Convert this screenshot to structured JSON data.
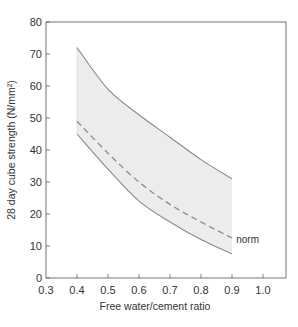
{
  "chart_data": {
    "type": "line",
    "title": "",
    "xlabel": "Free water/cement ratio",
    "ylabel": "28 day cube strength (N/mm²)",
    "xlim": [
      0.3,
      1.05
    ],
    "ylim": [
      0,
      80
    ],
    "xticks": [
      0.3,
      0.4,
      0.5,
      0.6,
      0.7,
      0.8,
      0.9,
      1.0
    ],
    "xtick_labels": [
      "0.3",
      "0.4",
      "0.5",
      "0.6",
      "0.7",
      "0.8",
      "0.9",
      "1.0"
    ],
    "yticks": [
      0,
      10,
      20,
      30,
      40,
      50,
      60,
      70,
      80
    ],
    "ytick_labels": [
      "0",
      "10",
      "20",
      "30",
      "40",
      "50",
      "60",
      "70",
      "80"
    ],
    "grid": false,
    "frame": "box",
    "x": [
      0.4,
      0.5,
      0.6,
      0.7,
      0.8,
      0.9
    ],
    "series": [
      {
        "name": "upper bound",
        "style": "solid",
        "values": [
          72,
          59,
          51,
          44,
          37,
          31
        ]
      },
      {
        "name": "norm",
        "style": "dashed",
        "values": [
          49,
          39,
          30,
          23,
          17.5,
          12.5
        ]
      },
      {
        "name": "lower bound",
        "style": "solid",
        "values": [
          45,
          34,
          24,
          17.5,
          12,
          7.5
        ]
      }
    ],
    "shaded_band": {
      "between": [
        "upper bound",
        "lower bound"
      ],
      "color": "#ececec"
    },
    "annotations": [
      {
        "text": "norm",
        "x": 0.92,
        "y": 12
      }
    ],
    "colors": {
      "line": "#8a8a8a",
      "axis": "#666666",
      "fill": "#ececec",
      "text": "#333333"
    }
  }
}
